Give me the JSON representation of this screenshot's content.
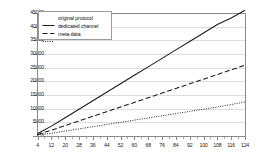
{
  "chart_data": {
    "type": "line",
    "title": "",
    "xlabel": "",
    "ylabel": "",
    "xlim": [
      4,
      124
    ],
    "ylim": [
      0,
      45000
    ],
    "ytick_values": [
      0,
      5000,
      10000,
      15000,
      20000,
      25000,
      30000,
      35000,
      40000,
      45000
    ],
    "ytick_labels": [
      "0",
      "5000",
      "10000",
      "15000",
      "20000",
      "25000",
      "30000",
      "35000",
      "40000",
      "45000"
    ],
    "xtick_values": [
      4,
      12,
      20,
      28,
      36,
      44,
      52,
      60,
      68,
      76,
      84,
      92,
      100,
      108,
      116,
      124
    ],
    "xtick_labels": [
      "4",
      "12",
      "20",
      "28",
      "36",
      "44",
      "52",
      "60",
      "68",
      "76",
      "84",
      "92",
      "100",
      "108",
      "116",
      "124"
    ],
    "x_minor_step": 4,
    "grid": {
      "horizontal": true,
      "vertical": false,
      "color": "#dcdcdc"
    },
    "legend": {
      "position": "top-left-inside",
      "border_color": "#9a9a9a",
      "entries": [
        {
          "label": "original protocol",
          "style": "solid",
          "color": "#1a1a1a"
        },
        {
          "label": "dedicated channel",
          "style": "dashed",
          "color": "#1a1a1a"
        },
        {
          "label": "meta-data",
          "style": "dotted",
          "color": "#1a1a1a"
        }
      ]
    },
    "x": [
      4,
      12,
      20,
      28,
      36,
      44,
      52,
      60,
      68,
      76,
      84,
      92,
      100,
      108,
      116,
      124
    ],
    "series": [
      {
        "name": "original protocol",
        "style": "solid",
        "color": "#1a1a1a",
        "values": [
          800,
          3600,
          6700,
          9800,
          12900,
          16000,
          19100,
          22200,
          25300,
          28400,
          31500,
          34600,
          37700,
          40800,
          43200,
          46000
        ]
      },
      {
        "name": "dedicated channel",
        "style": "dashed",
        "color": "#1a1a1a",
        "values": [
          500,
          2100,
          3800,
          5500,
          7200,
          8900,
          10600,
          12300,
          14000,
          15700,
          17400,
          19100,
          20800,
          22500,
          24200,
          25900
        ]
      },
      {
        "name": "meta-data",
        "style": "dotted",
        "color": "#1a1a1a",
        "values": [
          300,
          1000,
          1800,
          2600,
          3400,
          4200,
          5000,
          5800,
          6600,
          7400,
          8200,
          9000,
          9800,
          10600,
          11500,
          12500
        ]
      }
    ]
  }
}
